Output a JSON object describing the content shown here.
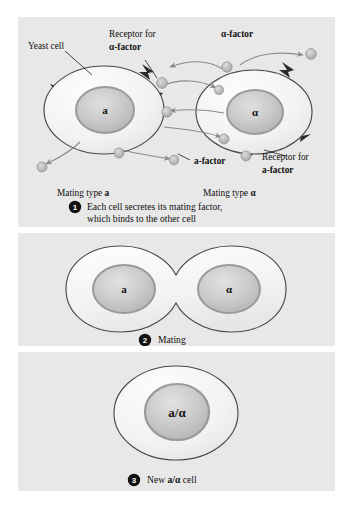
{
  "figure": {
    "background_color": "#ffffff",
    "panel_color": "#e8e8e8"
  },
  "colors": {
    "membrane_stroke": "#4a4a4a",
    "cytoplasm_fill": "#f4f4f4",
    "nucleus_fill": "#c9c9c9",
    "nucleus_stroke": "#8e8e8e",
    "receptor_fill": "#2b2b2b",
    "pheromone_fill": "#b8b8b8",
    "arrow_color": "#8a8a8a",
    "text_color": "#101010"
  },
  "panels": [
    {
      "id": "panel-1",
      "number": "1",
      "caption_line_1": "Each cell secretes its mating factor,",
      "caption_line_2": "which binds to the other cell",
      "labels": {
        "yeast_cell": "Yeast cell",
        "receptor_alpha_line_1": "Receptor for",
        "receptor_alpha_line_2": "α-factor",
        "alpha_factor": "α-factor",
        "a_factor": "a-factor",
        "receptor_a_line_1": "Receptor for",
        "receptor_a_line_2": "a-factor",
        "mating_type_a_prefix": "Mating type ",
        "mating_type_a_value": "a",
        "mating_type_alpha_prefix": "Mating type ",
        "mating_type_alpha_value": "α"
      },
      "cells": [
        {
          "name": "cell-a",
          "nucleus_label": "a"
        },
        {
          "name": "cell-alpha",
          "nucleus_label": "α"
        }
      ]
    },
    {
      "id": "panel-2",
      "number": "2",
      "caption_line_1": "Mating",
      "caption_line_2": "",
      "cells": [
        {
          "name": "cell-a",
          "nucleus_label": "a"
        },
        {
          "name": "cell-alpha",
          "nucleus_label": "α"
        }
      ]
    },
    {
      "id": "panel-3",
      "number": "3",
      "caption_prefix": "New ",
      "caption_bold": "a/α",
      "caption_suffix": " cell",
      "cells": [
        {
          "name": "cell-a-alpha",
          "nucleus_label": "a/α"
        }
      ]
    }
  ]
}
